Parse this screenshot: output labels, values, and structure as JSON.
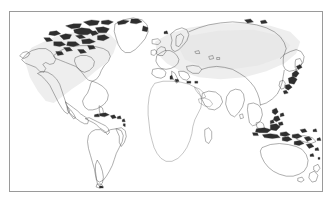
{
  "document": {
    "type": "world-map",
    "title": "Blank World Map",
    "projection": "cylindrical",
    "background_color": "#ffffff",
    "frame_color": "#9a9a9a",
    "coastline_color": "#4a4a4a",
    "land_tint_color": "#e6e6e6",
    "labels_visible": "false",
    "graticule_visible": "false",
    "legend_visible": "false",
    "antarctica_visible": "false"
  },
  "frame": {
    "x": 9,
    "y": 11,
    "width": 314,
    "height": 181,
    "border_width": 1
  },
  "map": {
    "viewbox": "0 0 314 181",
    "continents": [
      {
        "name": "North America",
        "data_name": "continent-north-america",
        "tinted": "true",
        "bbox": [
          6,
          8,
          120,
          105
        ]
      },
      {
        "name": "South America",
        "data_name": "continent-south-america",
        "tinted": "false",
        "bbox": [
          58,
          95,
          112,
          178
        ]
      },
      {
        "name": "Greenland",
        "data_name": "landmass-greenland",
        "tinted": "false",
        "bbox": [
          98,
          5,
          140,
          42
        ]
      },
      {
        "name": "Europe",
        "data_name": "continent-europe",
        "tinted": "true",
        "bbox": [
          130,
          15,
          200,
          70
        ]
      },
      {
        "name": "Africa",
        "data_name": "continent-africa",
        "tinted": "false",
        "bbox": [
          138,
          62,
          205,
          160
        ]
      },
      {
        "name": "Asia",
        "data_name": "continent-asia",
        "tinted": "true",
        "bbox": [
          175,
          5,
          300,
          125
        ]
      },
      {
        "name": "Australia",
        "data_name": "continent-australia",
        "tinted": "false",
        "bbox": [
          250,
          128,
          302,
          165
        ]
      },
      {
        "name": "New Zealand",
        "data_name": "landmass-new-zealand",
        "tinted": "false",
        "bbox": [
          300,
          152,
          315,
          176
        ]
      }
    ],
    "island_groups": [
      {
        "name": "Canadian Arctic Archipelago",
        "data_name": "islands-canadian-arctic"
      },
      {
        "name": "Caribbean Islands",
        "data_name": "islands-caribbean"
      },
      {
        "name": "British Isles",
        "data_name": "islands-british-isles"
      },
      {
        "name": "Mediterranean Islands",
        "data_name": "islands-mediterranean"
      },
      {
        "name": "Japan",
        "data_name": "islands-japan"
      },
      {
        "name": "Philippines",
        "data_name": "islands-philippines"
      },
      {
        "name": "Indonesia",
        "data_name": "islands-indonesia"
      },
      {
        "name": "Pacific Islands",
        "data_name": "islands-pacific"
      },
      {
        "name": "Madagascar",
        "data_name": "island-madagascar"
      },
      {
        "name": "Iceland",
        "data_name": "island-iceland"
      },
      {
        "name": "Sri Lanka",
        "data_name": "island-sri-lanka"
      }
    ]
  }
}
